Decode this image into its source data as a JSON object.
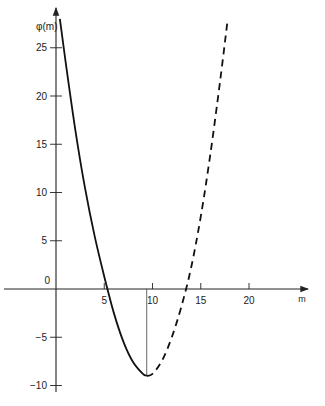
{
  "chart_data": {
    "type": "line",
    "title": "",
    "xlabel": "m",
    "ylabel": "φ(m)",
    "xlim": [
      -2,
      26
    ],
    "ylim": [
      -11,
      28
    ],
    "x_ticks": [
      5,
      10,
      15,
      20
    ],
    "y_ticks": [
      25,
      20,
      15,
      10,
      5,
      -5,
      -10
    ],
    "origin_label": "0",
    "grid": false,
    "legend": null,
    "series": [
      {
        "name": "solid",
        "style": "solid",
        "x": [
          0.4,
          1,
          2,
          3,
          4,
          5,
          6,
          7,
          8,
          9,
          9.4
        ],
        "y": [
          28,
          23.5,
          16.5,
          10.5,
          5.5,
          1.3,
          -2.5,
          -5.5,
          -7.6,
          -8.8,
          -9.0
        ]
      },
      {
        "name": "dashed",
        "style": "dashed",
        "x": [
          9.4,
          10,
          11,
          12,
          13,
          14,
          15,
          16,
          17,
          17.8
        ],
        "y": [
          -9.0,
          -8.8,
          -7.4,
          -5.0,
          -1.8,
          2.2,
          7.5,
          14,
          21.5,
          28
        ]
      }
    ],
    "annotations": [
      {
        "type": "vertical_line",
        "x": 9.4,
        "from_y": 0,
        "to_y": -9.0,
        "note": "drop line at minimum"
      }
    ]
  }
}
